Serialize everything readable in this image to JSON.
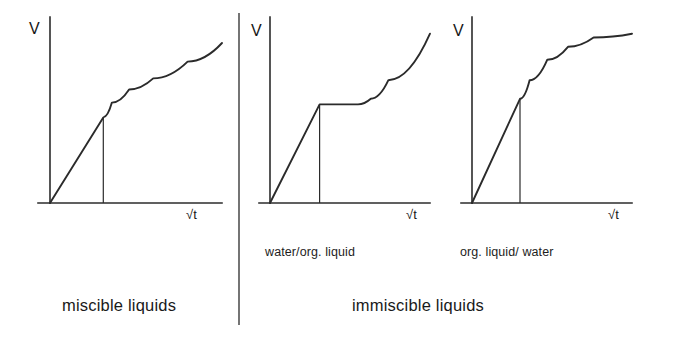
{
  "figure": {
    "axis_color": "#2b2b2b",
    "background": "#ffffff",
    "panel_captions": {
      "panel2": "water/org. liquid",
      "panel3": "org. liquid/ water"
    },
    "group_captions": {
      "left": "miscible liquids",
      "right": "immiscible liquids"
    }
  },
  "chart_data": [
    {
      "type": "line",
      "title": "miscible liquids",
      "xlabel": "√t",
      "ylabel": "V",
      "grid": false,
      "legend": null,
      "xlim": [
        0,
        10
      ],
      "ylim": [
        0,
        10
      ],
      "annotations": [
        "breakpoint marker drop-line at x = 3.1"
      ],
      "series": [
        {
          "name": "capillary uptake (miscible)",
          "x": [
            0.0,
            3.1,
            3.6,
            4.6,
            6.0,
            8.0,
            10.0
          ],
          "y": [
            0.0,
            4.6,
            5.4,
            6.1,
            6.7,
            7.6,
            8.6
          ]
        }
      ]
    },
    {
      "type": "line",
      "title": "water/org. liquid",
      "xlabel": "√t",
      "ylabel": "V",
      "grid": false,
      "legend": null,
      "xlim": [
        0,
        10
      ],
      "ylim": [
        0,
        10
      ],
      "annotations": [
        "breakpoint marker drop-line at x = 3.1",
        "plateau between x = 3.1 and x = 5.5"
      ],
      "series": [
        {
          "name": "capillary uptake (water then organic liquid)",
          "x": [
            0.0,
            3.1,
            5.5,
            6.3,
            7.4,
            10.0
          ],
          "y": [
            0.0,
            5.3,
            5.3,
            5.6,
            6.6,
            9.1
          ]
        }
      ]
    },
    {
      "type": "line",
      "title": "org. liquid/ water",
      "xlabel": "√t",
      "ylabel": "V",
      "grid": false,
      "legend": null,
      "xlim": [
        0,
        10
      ],
      "ylim": [
        0,
        10
      ],
      "annotations": [
        "breakpoint marker drop-line at x = 3.0",
        "saturation plateau approached near y = 9.1"
      ],
      "series": [
        {
          "name": "capillary uptake (organic liquid then water)",
          "x": [
            0.0,
            3.0,
            3.6,
            4.7,
            6.0,
            7.6,
            10.0
          ],
          "y": [
            0.0,
            5.6,
            6.6,
            7.7,
            8.4,
            8.9,
            9.1
          ]
        }
      ]
    }
  ]
}
